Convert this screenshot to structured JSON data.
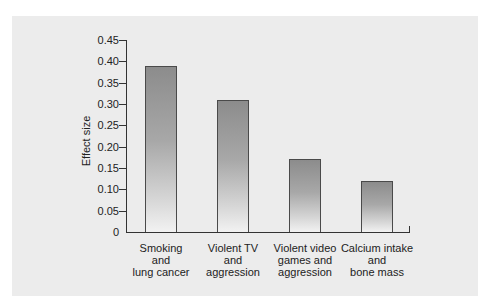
{
  "chart_data": {
    "type": "bar",
    "title": "",
    "xlabel": "",
    "ylabel": "Effect size",
    "ylim": [
      0,
      0.45
    ],
    "yticks": [
      "0",
      "0.05",
      "0.10",
      "0.15",
      "0.20",
      "0.25",
      "0.30",
      "0.35",
      "0.40",
      "0.45"
    ],
    "grid": false,
    "legend": null,
    "categories": [
      "Smoking and lung cancer",
      "Violent TV and aggression",
      "Violent video games and aggression",
      "Calcium intake and bone mass"
    ],
    "category_lines": [
      [
        "Smoking",
        "and",
        "lung cancer"
      ],
      [
        "Violent TV",
        "and",
        "aggression"
      ],
      [
        "Violent video",
        "games and",
        "aggression"
      ],
      [
        "Calcium intake",
        "and",
        "bone mass"
      ]
    ],
    "values": [
      0.39,
      0.31,
      0.17,
      0.12
    ]
  }
}
